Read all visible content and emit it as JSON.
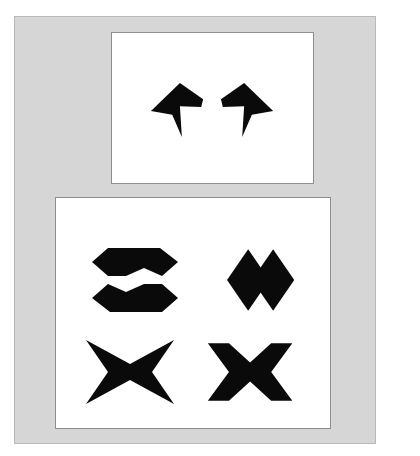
{
  "task": {
    "type": "non-verbal-reasoning-shape-matching",
    "artifact_text": "",
    "background_color": "#ffffff",
    "board_color": "#d6d6d6",
    "board_border_color": "#b9b9b9",
    "panel_color": "#ffffff",
    "panel_border_color": "#8e8e8e",
    "shape_color": "#0a0a0a"
  },
  "stimulus_panel": {
    "name": "stimulus-panel",
    "shape_count": 2,
    "shapes": [
      {
        "id": "stimulus-shape-1",
        "label": "arrow-notched-left",
        "description": "concave arrowhead / notched chevron pointing up-right with downward tail",
        "points": "0,31 30,2 54,19 52,27 30,26 32,58 22,35"
      },
      {
        "id": "stimulus-shape-2",
        "label": "arrow-notched-right",
        "description": "mirror image of shape 1, notched chevron pointing up-left with downward tail",
        "points": "54,31 24,2 0,19 2,27 24,26 22,58 32,35"
      }
    ]
  },
  "options_panel": {
    "name": "options-panel",
    "option_count": 4,
    "options": [
      {
        "id": "option-a",
        "position": "top-left",
        "label": "stacked-hexagon-arrows",
        "description": "two horizontally-flattened hexagon arrow bands stacked vertically, top band notched on the right, bottom band notched on the left",
        "paths": [
          "10,16 26,2 78,2 96,16 80,30 62,22 44,30 26,30",
          "96,52 80,66 28,66 10,52 26,38 44,46 62,38 80,38"
        ]
      },
      {
        "id": "option-b",
        "position": "top-right",
        "label": "twin-diamonds",
        "description": "two solid rhombi side by side meeting near the centre",
        "paths": [
          "24,34 46,2 68,34 46,66",
          "50,34 72,2 94,34 72,66"
        ]
      },
      {
        "id": "option-c",
        "position": "bottom-left",
        "label": "four-point-star",
        "description": "four pointed star / concave bowtie with curved-in top and bottom edges",
        "paths": [
          "4,2 48,26 92,2 70,34 92,66 48,42 4,66 26,34"
        ]
      },
      {
        "id": "option-d",
        "position": "bottom-right",
        "label": "saltire-cross",
        "description": "thick X shaped cross formed of two crossing angled bands",
        "paths": [
          "4,4 26,4 48,24 70,4 92,4 70,34 92,64 70,64 48,44 26,64 4,64 26,34"
        ]
      }
    ]
  }
}
